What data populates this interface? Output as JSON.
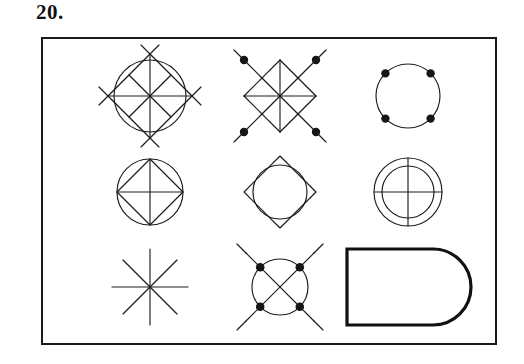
{
  "item": {
    "number_label": "20.",
    "type": "figure-matrix",
    "rows": 3,
    "columns": 3,
    "frame": {
      "border_color": "#1a1a1a",
      "border_width_px": 2,
      "background": "#ffffff"
    },
    "ink_color": "#1c1c1c"
  },
  "figures": [
    {
      "position": "row1-col1",
      "name": "circle-with-diamond-lattice",
      "description": "Circle overlaid with a 2x2 lattice of diamonds whose diagonal lines extend past the circle",
      "elements": [
        "circle",
        "diagonal-lattice",
        "crossing-tails"
      ],
      "dots": 0
    },
    {
      "position": "row1-col2",
      "name": "diamond-lattice-with-dots",
      "description": "2x2 lattice of four diamonds with filled dots at the four outer corners and short tails",
      "elements": [
        "diagonal-lattice",
        "crossing-tails"
      ],
      "dots": 4
    },
    {
      "position": "row1-col3",
      "name": "circle-with-four-dots",
      "description": "Plain circle with four filled dots at the 45 degree diagonal points",
      "elements": [
        "circle"
      ],
      "dots": 4
    },
    {
      "position": "row2-col1",
      "name": "circle-with-inscribed-diamond-and-cross",
      "description": "Circle containing an inscribed diamond plus horizontal and vertical diameters",
      "elements": [
        "circle",
        "inscribed-diamond",
        "cross"
      ],
      "dots": 0
    },
    {
      "position": "row2-col2",
      "name": "diamond-with-inscribed-circle",
      "description": "Diamond outline with a circle inscribed inside it touching the edge midpoints",
      "elements": [
        "diamond",
        "circle"
      ],
      "dots": 0
    },
    {
      "position": "row2-col3",
      "name": "concentric-circles-with-cross",
      "description": "Two concentric circles with horizontal and vertical lines crossing through the centre",
      "elements": [
        "outer-circle",
        "inner-circle",
        "cross"
      ],
      "dots": 0
    },
    {
      "position": "row3-col1",
      "name": "eight-point-asterisk",
      "description": "Eight-pointed asterisk formed by four lines crossing at the centre",
      "elements": [
        "asterisk"
      ],
      "dots": 0
    },
    {
      "position": "row3-col2",
      "name": "circle-with-x-and-dots",
      "description": "Circle crossed by an X with filled dots where the X meets the circle and tails extending outward",
      "elements": [
        "circle",
        "x-cross",
        "crossing-tails"
      ],
      "dots": 4
    },
    {
      "position": "row3-col3",
      "name": "d-shape-rounded-right-end",
      "description": "Thick-outlined rectangle with a semicircular rounded right end",
      "elements": [
        "rectangle",
        "semicircular-end"
      ],
      "dots": 0
    }
  ]
}
